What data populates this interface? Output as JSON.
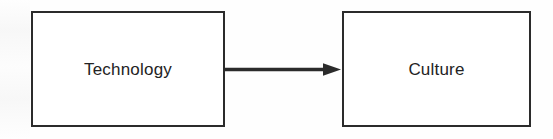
{
  "diagram": {
    "type": "flow",
    "background_color": "#fefefe",
    "stroke_color": "#2b2b2b",
    "text_color": "#232323",
    "nodes": [
      {
        "id": "technology",
        "label": "Technology",
        "shape": "rectangle"
      },
      {
        "id": "culture",
        "label": "Culture",
        "shape": "rectangle"
      }
    ],
    "edges": [
      {
        "id": "technology-to-culture",
        "from": "technology",
        "to": "culture",
        "label": "",
        "style": "solid",
        "arrowhead": "filled-triangle",
        "direction": "right"
      }
    ]
  }
}
